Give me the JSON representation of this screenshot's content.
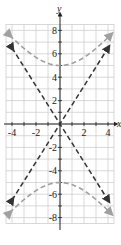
{
  "chart_data": {
    "type": "line",
    "title": "",
    "xlabel": "x",
    "ylabel": "y",
    "xlim": [
      -4.5,
      4.5
    ],
    "ylim": [
      -8.5,
      8.5
    ],
    "grid": true,
    "x_ticks": [
      "-4",
      "-2",
      "2",
      "4"
    ],
    "y_ticks": [
      "8",
      "6",
      "4",
      "2",
      "-2",
      "-4",
      "-6",
      "-8"
    ],
    "series": [
      {
        "name": "hyperbola upper branch",
        "style": "dashed gray",
        "color": "#a0a0a0",
        "x": [
          -4.2,
          -3,
          -2,
          -1,
          0,
          1,
          2,
          3,
          4.2
        ],
        "y": [
          7.6,
          6.7,
          5.9,
          5.2,
          5.0,
          5.2,
          5.9,
          6.7,
          7.6
        ]
      },
      {
        "name": "hyperbola lower branch",
        "style": "dashed gray",
        "color": "#a0a0a0",
        "x": [
          -4.2,
          -3,
          -2,
          -1,
          0,
          1,
          2,
          3,
          4.2
        ],
        "y": [
          -7.6,
          -6.7,
          -5.9,
          -5.2,
          -5.0,
          -5.2,
          -5.9,
          -6.7,
          -7.6
        ]
      },
      {
        "name": "asymptote y=(5/3)x",
        "style": "dashed black",
        "color": "#333333",
        "x": [
          -4,
          4
        ],
        "y": [
          -6.5,
          6.5
        ]
      },
      {
        "name": "asymptote y=-(5/3)x",
        "style": "dashed black",
        "color": "#333333",
        "x": [
          -4,
          4
        ],
        "y": [
          6.5,
          -6.5
        ]
      }
    ]
  },
  "axes": {
    "x_label": "x",
    "y_label": "y"
  },
  "ticks": {
    "x": [
      {
        "v": -4,
        "t": "-4"
      },
      {
        "v": -2,
        "t": "-2"
      },
      {
        "v": 2,
        "t": "2"
      },
      {
        "v": 4,
        "t": "4"
      }
    ],
    "y": [
      {
        "v": 8,
        "t": "8"
      },
      {
        "v": 6,
        "t": "6"
      },
      {
        "v": 4,
        "t": "4"
      },
      {
        "v": 2,
        "t": "2"
      },
      {
        "v": -2,
        "t": "-2"
      },
      {
        "v": -4,
        "t": "-4"
      },
      {
        "v": -6,
        "t": "-6"
      },
      {
        "v": -8,
        "t": "-8"
      }
    ]
  }
}
